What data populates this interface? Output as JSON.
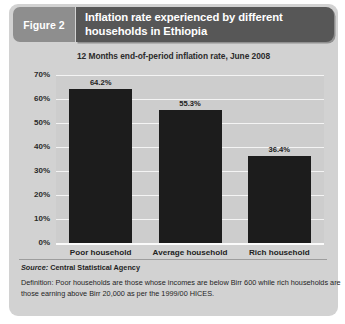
{
  "figure": {
    "tag": "Figure 2",
    "title": "Inflation rate experienced by different households in Ethiopia",
    "subtitle": "12 Months end-of-period inflation rate, June 2008"
  },
  "footer": {
    "source_label": "Source:",
    "source_value": "Central Statistical Agency",
    "definition_line1": "Definition: Poor households are those whose incomes are below Birr 600 while rich households are",
    "definition_line2": "those earning above Birr 20,000 as per the 1999/00 HICES."
  },
  "colors": {
    "panel": "#d2d2d2",
    "title_bar": "#575757",
    "figure_tag": "#8e8e8e",
    "bar": "#1c1c1c",
    "plot_background": "#cdcdcd",
    "gridline": "#f4f4f4"
  },
  "chart_data": {
    "type": "bar",
    "title": "Inflation rate experienced by different households in Ethiopia",
    "subtitle": "12 Months end-of-period inflation rate, June 2008",
    "xlabel": "",
    "ylabel": "",
    "categories": [
      "Poor household",
      "Average household",
      "Rich household"
    ],
    "values": [
      64.2,
      55.3,
      36.4
    ],
    "value_labels": [
      "64.2%",
      "55.3%",
      "36.4%"
    ],
    "ylim": [
      0,
      70
    ],
    "ytick_values": [
      0,
      10,
      20,
      30,
      40,
      50,
      60,
      70
    ],
    "ytick_labels": [
      "0%",
      "10%",
      "20%",
      "30%",
      "40%",
      "50%",
      "60%",
      "70%"
    ],
    "grid": true,
    "legend": false,
    "units": "percent"
  }
}
